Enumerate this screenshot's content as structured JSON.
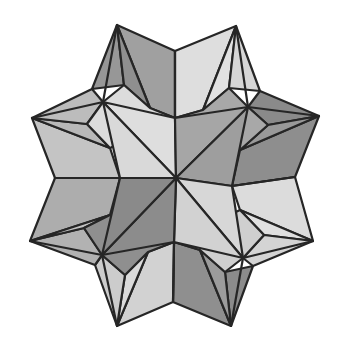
{
  "figure": {
    "colors": {
      "lightest": "#e4e4e4",
      "light": "#cfcfcf",
      "mid": "#b2b2b2",
      "dark": "#979797",
      "darker": "#858585",
      "edge": "#262626",
      "background": "#ffffff"
    },
    "points": {
      "C": [
        176,
        178
      ],
      "T_L": [
        117,
        25
      ],
      "T_N": [
        175,
        51
      ],
      "T_R": [
        236,
        26
      ],
      "R_U": [
        319,
        116
      ],
      "R_N": [
        295,
        177
      ],
      "R_L": [
        313,
        241
      ],
      "B_R": [
        231,
        326
      ],
      "B_N": [
        173,
        302
      ],
      "B_L": [
        117,
        326
      ],
      "L_L": [
        30,
        241
      ],
      "L_N": [
        55,
        178
      ],
      "L_U": [
        32,
        118
      ],
      "IC_UL": [
        103,
        102
      ],
      "IC_UR": [
        248,
        107
      ],
      "IC_LR": [
        243,
        258
      ],
      "IC_LL": [
        102,
        255
      ],
      "M_T": [
        175,
        118
      ],
      "M_R": [
        232,
        186
      ],
      "M_B": [
        174,
        242
      ],
      "M_L": [
        120,
        178
      ],
      "N_UL": [
        92,
        89
      ],
      "K_UL": [
        124,
        85
      ],
      "K_UL2": [
        87,
        124
      ],
      "N_UR": [
        260,
        91
      ],
      "K_UR": [
        229,
        88
      ],
      "K_UR2": [
        268,
        125
      ],
      "N_LR": [
        253,
        266
      ],
      "K_LR": [
        225,
        272
      ],
      "K_LR2": [
        264,
        235
      ],
      "N_LL": [
        95,
        265
      ],
      "K_LL": [
        125,
        275
      ],
      "K_LL2": [
        84,
        228
      ]
    }
  }
}
